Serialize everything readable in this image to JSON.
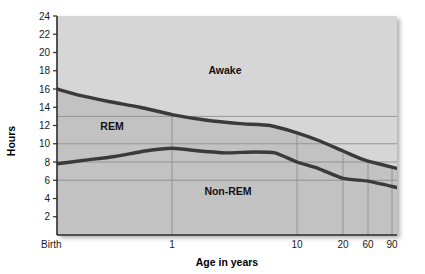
{
  "chart_data": {
    "type": "area",
    "title": "",
    "xlabel": "Age in years",
    "ylabel": "Hours",
    "x_scale": "log-like",
    "grid": true,
    "legend_position": "inline-annotations",
    "ylim": [
      0,
      24
    ],
    "y_ticks": [
      2,
      4,
      6,
      8,
      10,
      12,
      14,
      16,
      18,
      20,
      22,
      24
    ],
    "y_gridlines": [
      13,
      10,
      8,
      6
    ],
    "x_ticks": [
      "Birth",
      "1",
      "10",
      "20",
      "60",
      "90"
    ],
    "x_tick_positions_px": [
      57,
      172,
      297,
      343,
      368,
      392
    ],
    "annotations": [
      {
        "text": "Awake",
        "x_px": 225,
        "y_px": 74
      },
      {
        "text": "REM",
        "x_px": 112,
        "y_px": 130
      },
      {
        "text": "Non-REM",
        "x_px": 228,
        "y_px": 195
      }
    ],
    "series": [
      {
        "name": "Total sleep (upper boundary, hours)",
        "description": "Boundary between Awake region above and REM region below",
        "points": [
          {
            "x_label": "Birth",
            "x_px": 57,
            "value": 16.0
          },
          {
            "x_label": "",
            "x_px": 80,
            "value": 15.3
          },
          {
            "x_label": "",
            "x_px": 110,
            "value": 14.6
          },
          {
            "x_label": "",
            "x_px": 140,
            "value": 14.0
          },
          {
            "x_label": "1",
            "x_px": 172,
            "value": 13.2
          },
          {
            "x_label": "",
            "x_px": 205,
            "value": 12.6
          },
          {
            "x_label": "",
            "x_px": 240,
            "value": 12.2
          },
          {
            "x_label": "",
            "x_px": 270,
            "value": 12.0
          },
          {
            "x_label": "10",
            "x_px": 297,
            "value": 11.2
          },
          {
            "x_label": "",
            "x_px": 320,
            "value": 10.3
          },
          {
            "x_label": "20",
            "x_px": 343,
            "value": 9.2
          },
          {
            "x_label": "",
            "x_px": 360,
            "value": 8.4
          },
          {
            "x_label": "60",
            "x_px": 368,
            "value": 8.1
          },
          {
            "x_label": "90",
            "x_px": 397,
            "value": 7.3
          }
        ]
      },
      {
        "name": "Non-REM sleep (lower boundary, hours)",
        "description": "Boundary between REM region above and Non-REM region below",
        "points": [
          {
            "x_label": "Birth",
            "x_px": 57,
            "value": 7.8
          },
          {
            "x_label": "",
            "x_px": 85,
            "value": 8.2
          },
          {
            "x_label": "",
            "x_px": 115,
            "value": 8.6
          },
          {
            "x_label": "",
            "x_px": 145,
            "value": 9.2
          },
          {
            "x_label": "1",
            "x_px": 172,
            "value": 9.5
          },
          {
            "x_label": "",
            "x_px": 200,
            "value": 9.2
          },
          {
            "x_label": "",
            "x_px": 225,
            "value": 9.0
          },
          {
            "x_label": "",
            "x_px": 255,
            "value": 9.1
          },
          {
            "x_label": "",
            "x_px": 275,
            "value": 9.0
          },
          {
            "x_label": "10",
            "x_px": 297,
            "value": 8.0
          },
          {
            "x_label": "",
            "x_px": 318,
            "value": 7.3
          },
          {
            "x_label": "20",
            "x_px": 343,
            "value": 6.2
          },
          {
            "x_label": "60",
            "x_px": 368,
            "value": 5.9
          },
          {
            "x_label": "90",
            "x_px": 397,
            "value": 5.2
          }
        ]
      }
    ],
    "regions": [
      {
        "name": "Awake",
        "fill": "#d2d2d2"
      },
      {
        "name": "REM",
        "fill": "#bfbfbf"
      },
      {
        "name": "Non-REM",
        "fill": "#bfbfbf"
      }
    ],
    "colors": {
      "plot_background": "#c6c6c6",
      "awake_background": "#d4d4d4",
      "curve": "#3a3a3a",
      "gridline": "#8e8e8e",
      "axis": "#2b2b2b",
      "text": "#111111",
      "page_background": "#ffffff"
    }
  },
  "axes": {
    "y_title": "Hours",
    "x_title": "Age in years"
  }
}
